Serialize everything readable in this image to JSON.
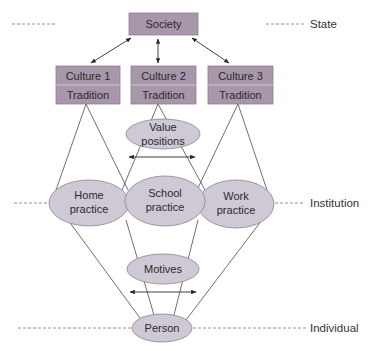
{
  "colors": {
    "box_fill": "#a896ab",
    "box_stroke": "#8e7d92",
    "ellipse_fill": "#cfc9d6",
    "ellipse_stroke": "#8a8490",
    "line": "#4a4a4a",
    "dashed": "#777777"
  },
  "levels": {
    "state": "State",
    "institution": "Institution",
    "individual": "Individual"
  },
  "society": {
    "label": "Society"
  },
  "cultures": [
    {
      "label": "Culture 1",
      "sub": "Tradition"
    },
    {
      "label": "Culture 2",
      "sub": "Tradition"
    },
    {
      "label": "Culture 3",
      "sub": "Tradition"
    }
  ],
  "value_positions": {
    "line1": "Value",
    "line2": "positions"
  },
  "practices": [
    {
      "line1": "Home",
      "line2": "practice"
    },
    {
      "line1": "School",
      "line2": "practice"
    },
    {
      "line1": "Work",
      "line2": "practice"
    }
  ],
  "motives": {
    "label": "Motives"
  },
  "person": {
    "label": "Person"
  }
}
